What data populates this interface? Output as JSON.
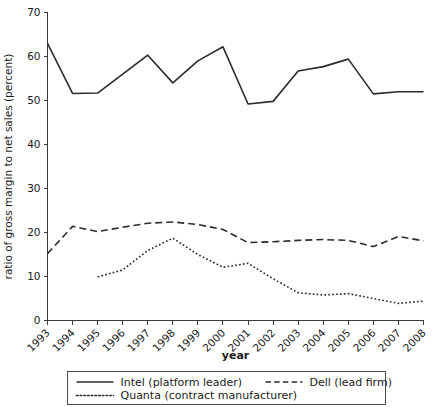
{
  "chart_data": {
    "type": "line",
    "title": "",
    "xlabel": "year",
    "ylabel": "ratio of gross margin to net sales (percent)",
    "x": [
      1993,
      1994,
      1995,
      1996,
      1997,
      1998,
      1999,
      2000,
      2001,
      2002,
      2003,
      2004,
      2005,
      2006,
      2007,
      2008
    ],
    "xtick_labels": [
      "1993",
      "1994",
      "1995",
      "1996",
      "1997",
      "1998",
      "1999",
      "2000",
      "2001",
      "2002",
      "2003",
      "2004",
      "2005",
      "2006",
      "2007",
      "2008"
    ],
    "ytick_labels": [
      "0",
      "10",
      "20",
      "30",
      "40",
      "50",
      "60",
      "70"
    ],
    "yticks": [
      0,
      10,
      20,
      30,
      40,
      50,
      60,
      70
    ],
    "xlim": [
      1993,
      2008
    ],
    "ylim": [
      0,
      70
    ],
    "grid": false,
    "legend_position": "below-axes",
    "series": [
      {
        "name": "Intel (platform leader)",
        "key": "intel",
        "style": "solid",
        "dasharray": "",
        "color": "#2b2b2b",
        "values": [
          63.0,
          51.6,
          51.7,
          56.0,
          60.3,
          54.0,
          59.0,
          62.2,
          49.2,
          49.8,
          56.7,
          57.7,
          59.4,
          51.5,
          52.0,
          52.0
        ]
      },
      {
        "name": "Dell (lead firm)",
        "key": "dell",
        "style": "dashed",
        "dasharray": "7,4",
        "color": "#2b2b2b",
        "values": [
          15.2,
          21.4,
          20.2,
          21.2,
          22.1,
          22.4,
          21.8,
          20.7,
          17.7,
          17.9,
          18.2,
          18.4,
          18.2,
          16.8,
          19.1,
          18.1
        ]
      },
      {
        "name": "Quanta (contract manufacturer)",
        "key": "quanta",
        "style": "dotted",
        "dasharray": "1.7,2.2",
        "color": "#2b2b2b",
        "values": [
          null,
          null,
          9.9,
          11.5,
          15.9,
          18.7,
          15.0,
          12.1,
          13.0,
          9.5,
          6.3,
          5.8,
          6.1,
          5.0,
          3.9,
          4.4
        ]
      }
    ]
  },
  "legend": {
    "entries": [
      {
        "label": "Intel (platform leader)",
        "style": "solid"
      },
      {
        "label": "Dell (lead firm)",
        "style": "dashed"
      },
      {
        "label": "Quanta (contract manufacturer)",
        "style": "dotted"
      }
    ]
  },
  "axis": {
    "y_title": "ratio of gross margin to net sales (percent)",
    "x_title": "year"
  }
}
